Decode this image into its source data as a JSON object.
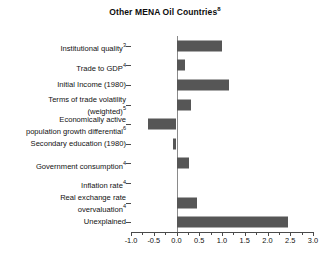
{
  "chart_data": {
    "type": "bar",
    "orientation": "horizontal",
    "title": "Other MENA Oil Countries",
    "title_superscript": "8",
    "xlabel": "",
    "ylabel": "",
    "xlim": [
      -1.0,
      3.0
    ],
    "xtick_step": 0.5,
    "xtick_labels": [
      "-1.0",
      "-0.5",
      "0.0",
      "0.5",
      "1.0",
      "1.5",
      "2.0",
      "2.5",
      "3.0"
    ],
    "xtick_values": [
      -1.0,
      -0.5,
      0.0,
      0.5,
      1.0,
      1.5,
      2.0,
      2.5,
      3.0
    ],
    "minor_tick_step": 0.25,
    "grid": false,
    "legend": null,
    "bar_color": "#565656",
    "axis_color": "#4a4a4a",
    "zero_line_color": "#8a8a8a",
    "categories": [
      "Institutional quality",
      "Trade to GDP",
      "Initial Income (1980)",
      "Terms of trade volatility\n(weighted)",
      "Economically active\npopulation growth differential",
      "Secondary education (1980)",
      "Government consumption",
      "Inflation rate",
      "Real exchange rate\novervaluation",
      "Unexplained"
    ],
    "category_superscripts": [
      "3",
      "4",
      "",
      "5",
      "6",
      "",
      "4",
      "4",
      "4",
      ""
    ],
    "values": [
      1.0,
      0.18,
      1.15,
      0.32,
      -0.62,
      -0.08,
      0.27,
      0.0,
      0.45,
      2.45
    ]
  }
}
